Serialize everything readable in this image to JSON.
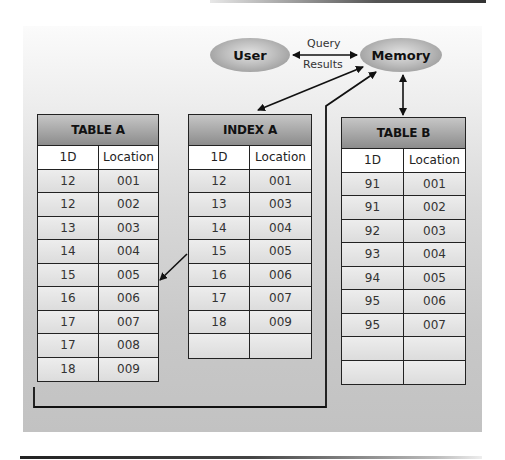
{
  "diagram": {
    "nodes": {
      "user": {
        "label": "User"
      },
      "memory": {
        "label": "Memory"
      }
    },
    "links": {
      "query_label": "Query",
      "results_label": "Results"
    },
    "tables": {
      "table_a": {
        "title": "TABLE A",
        "columns": [
          "1D",
          "Location"
        ],
        "rows": [
          [
            "12",
            "001"
          ],
          [
            "12",
            "002"
          ],
          [
            "13",
            "003"
          ],
          [
            "14",
            "004"
          ],
          [
            "15",
            "005"
          ],
          [
            "16",
            "006"
          ],
          [
            "17",
            "007"
          ],
          [
            "17",
            "008"
          ],
          [
            "18",
            "009"
          ]
        ]
      },
      "index_a": {
        "title": "INDEX A",
        "columns": [
          "1D",
          "Location"
        ],
        "rows": [
          [
            "12",
            "001"
          ],
          [
            "13",
            "003"
          ],
          [
            "14",
            "004"
          ],
          [
            "15",
            "005"
          ],
          [
            "16",
            "006"
          ],
          [
            "17",
            "007"
          ],
          [
            "18",
            "009"
          ],
          [
            "",
            ""
          ]
        ]
      },
      "table_b": {
        "title": "TABLE B",
        "columns": [
          "1D",
          "Location"
        ],
        "rows": [
          [
            "91",
            "001"
          ],
          [
            "91",
            "002"
          ],
          [
            "92",
            "003"
          ],
          [
            "93",
            "004"
          ],
          [
            "94",
            "005"
          ],
          [
            "95",
            "006"
          ],
          [
            "95",
            "007"
          ],
          [
            "",
            ""
          ],
          [
            "",
            ""
          ]
        ]
      }
    },
    "colors": {
      "panel_top": "#fbfbfb",
      "panel_bottom": "#c2c2c2",
      "header_top": "#c6c6c6",
      "header_bottom": "#8c8c8c",
      "line": "#222222"
    }
  }
}
